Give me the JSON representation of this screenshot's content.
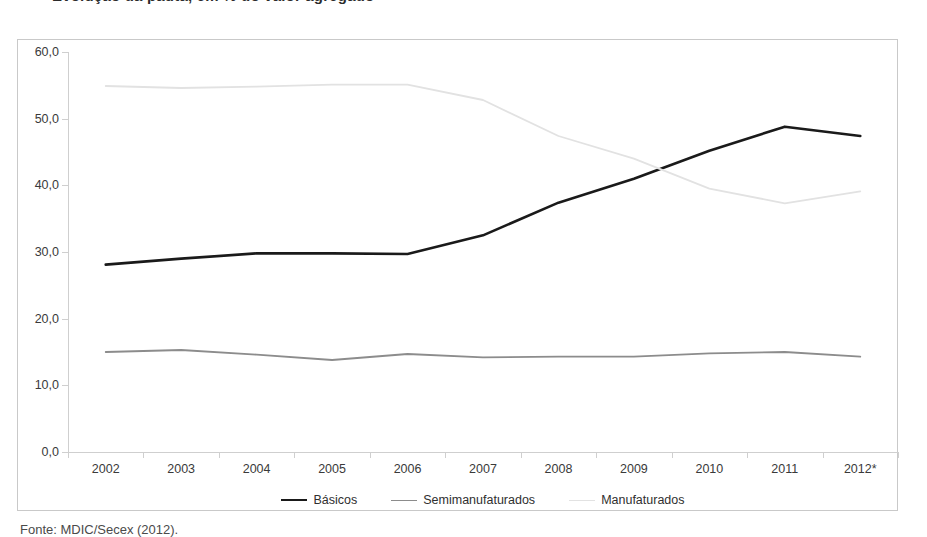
{
  "figure": {
    "title": "Evolução da pauta, em % do valor agregado",
    "source": "Fonte: MDIC/Secex (2012)."
  },
  "chart_data": {
    "type": "line",
    "title": "Evolução da pauta, em % do valor agregado",
    "xlabel": "",
    "ylabel": "",
    "categories": [
      "2002",
      "2003",
      "2004",
      "2005",
      "2006",
      "2007",
      "2008",
      "2009",
      "2010",
      "2011",
      "2012*"
    ],
    "ylim": [
      0,
      60
    ],
    "ytick_labels": [
      "0,0",
      "10,0",
      "20,0",
      "30,0",
      "40,0",
      "50,0",
      "60,0"
    ],
    "ytick_values": [
      0,
      10,
      20,
      30,
      40,
      50,
      60
    ],
    "grid": false,
    "legend_position": "bottom",
    "series": [
      {
        "name": "Básicos",
        "color": "#1a1a1a",
        "width": 2.6,
        "values": [
          28.1,
          29.0,
          29.8,
          29.8,
          29.7,
          32.5,
          37.4,
          41.0,
          45.2,
          48.8,
          47.4
        ]
      },
      {
        "name": "Semimanufaturados",
        "color": "#8c8c8c",
        "width": 1.8,
        "values": [
          15.0,
          15.3,
          14.6,
          13.8,
          14.7,
          14.2,
          14.3,
          14.3,
          14.8,
          15.0,
          14.3
        ]
      },
      {
        "name": "Manufaturados",
        "color": "#e2e2e2",
        "width": 1.8,
        "values": [
          54.9,
          54.6,
          54.8,
          55.1,
          55.1,
          52.8,
          47.4,
          44.0,
          39.5,
          37.3,
          39.1
        ]
      }
    ]
  }
}
